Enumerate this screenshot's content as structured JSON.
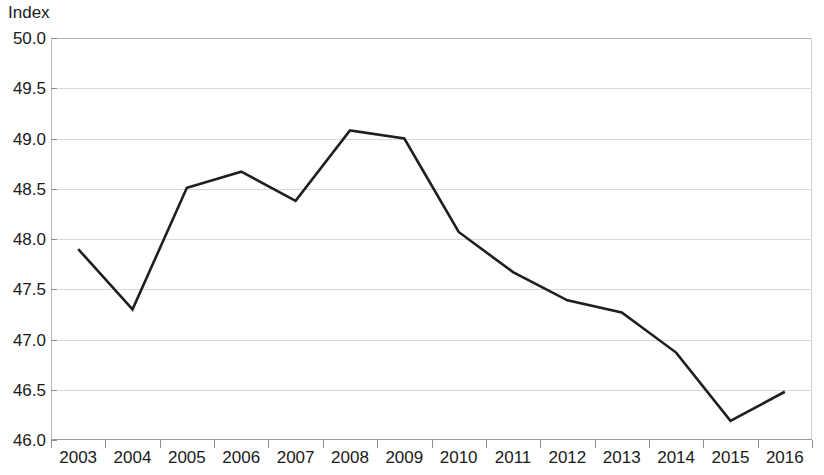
{
  "chart_data": {
    "type": "line",
    "title": "",
    "subtitle": "",
    "xlabel": "",
    "ylabel": "Index",
    "ylim": [
      46.0,
      50.0
    ],
    "ytick_step": 0.5,
    "yticks": [
      "50.0",
      "49.5",
      "49.0",
      "48.5",
      "48.0",
      "47.5",
      "47.0",
      "46.5",
      "46.0"
    ],
    "ytick_values": [
      50.0,
      49.5,
      49.0,
      48.5,
      48.0,
      47.5,
      47.0,
      46.5,
      46.0
    ],
    "grid": true,
    "grid_axis": "y",
    "legend": false,
    "legend_position": "none",
    "categories": [
      "2003",
      "2004",
      "2005",
      "2006",
      "2007",
      "2008",
      "2009",
      "2010",
      "2011",
      "2012",
      "2013",
      "2014",
      "2015",
      "2016"
    ],
    "values": [
      47.9,
      47.3,
      48.51,
      48.67,
      48.38,
      49.08,
      49.0,
      48.07,
      47.67,
      47.39,
      47.27,
      46.87,
      46.19,
      46.48
    ],
    "series": [
      {
        "name": "Index",
        "values": [
          47.9,
          47.3,
          48.51,
          48.67,
          48.38,
          49.08,
          49.0,
          48.07,
          47.67,
          47.39,
          47.27,
          46.87,
          46.19,
          46.48
        ]
      }
    ],
    "line_color": "#1f1f1f",
    "line_width": 2.6,
    "markers": false,
    "grid_color": "#d8d8d8",
    "axis_color": "#9a9a9a",
    "background_color": "#ffffff"
  }
}
